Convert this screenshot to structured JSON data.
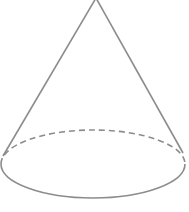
{
  "diagram": {
    "shape": "cone",
    "stroke_color": "#8c8c8c",
    "background": "#ffffff",
    "apex": {
      "x": 96,
      "y": -2
    },
    "base": {
      "cx": 93,
      "cy": 164,
      "rx": 92,
      "ry": 34
    },
    "hidden_edge_style": "dashed"
  }
}
